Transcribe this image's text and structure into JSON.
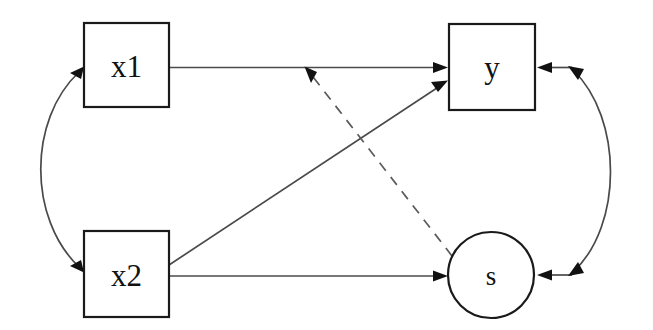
{
  "diagram": {
    "type": "path-diagram",
    "title": "",
    "background_color": "#ffffff",
    "stroke_color": "#1a1a1a",
    "edge_color": "#4a4a4a",
    "nodes": [
      {
        "id": "x1",
        "label": "x1",
        "shape": "rectangle",
        "x": 84,
        "y": 23,
        "width": 85,
        "height": 84,
        "center_x": 126,
        "center_y": 65
      },
      {
        "id": "x2",
        "label": "x2",
        "shape": "rectangle",
        "x": 84,
        "y": 231,
        "width": 85,
        "height": 86,
        "center_x": 126,
        "center_y": 274
      },
      {
        "id": "y",
        "label": "y",
        "shape": "rectangle",
        "x": 449,
        "y": 24,
        "width": 86,
        "height": 86,
        "center_x": 492,
        "center_y": 67
      },
      {
        "id": "s",
        "label": "s",
        "shape": "circle",
        "center_x": 491,
        "center_y": 275,
        "radius": 43
      }
    ],
    "edges": [
      {
        "id": "x1-to-y",
        "from": "x1",
        "to": "y",
        "style": "solid",
        "arrow": "single",
        "direction": "right"
      },
      {
        "id": "x2-to-y",
        "from": "x2",
        "to": "y",
        "style": "solid",
        "arrow": "single",
        "direction": "up-right"
      },
      {
        "id": "x2-to-s",
        "from": "x2",
        "to": "s",
        "style": "solid",
        "arrow": "single",
        "direction": "right"
      },
      {
        "id": "s-to-x1y-path",
        "from": "s",
        "to": "x1-to-y",
        "style": "dashed",
        "arrow": "single",
        "direction": "up-left"
      },
      {
        "id": "x1-x2-covariance",
        "from": "x1",
        "to": "x2",
        "style": "solid-curved",
        "arrow": "double",
        "side": "left"
      },
      {
        "id": "y-s-covariance",
        "from": "y",
        "to": "s",
        "style": "solid-curved",
        "arrow": "double",
        "side": "right"
      }
    ]
  }
}
